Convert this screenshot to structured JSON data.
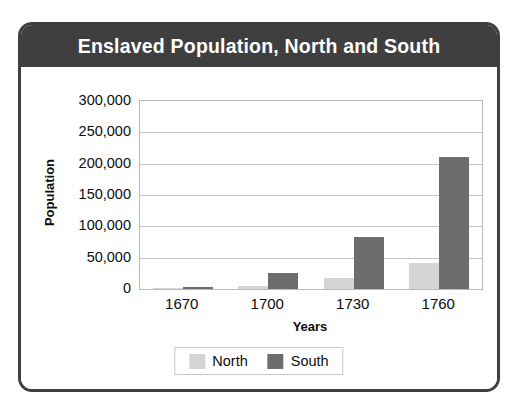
{
  "card": {
    "title": "Enslaved Population, North and South"
  },
  "chart_data": {
    "type": "bar",
    "title": "Enslaved Population, North and South",
    "xlabel": "Years",
    "ylabel": "Population",
    "categories": [
      "1670",
      "1700",
      "1730",
      "1760"
    ],
    "series": [
      {
        "name": "North",
        "color": "#d5d5d5",
        "values": [
          1100,
          5200,
          17000,
          41000
        ]
      },
      {
        "name": "South",
        "color": "#6d6d6d",
        "values": [
          2500,
          25000,
          83000,
          210000
        ]
      }
    ],
    "ylim": [
      0,
      300000
    ],
    "ytick_values": [
      0,
      50000,
      100000,
      150000,
      200000,
      250000,
      300000
    ],
    "ytick_labels": [
      "0",
      "50,000",
      "100,000",
      "150,000",
      "200,000",
      "250,000",
      "300,000"
    ],
    "grid": true,
    "legend_position": "bottom",
    "legend": [
      "North",
      "South"
    ]
  },
  "colors": {
    "title_bar": "#3f3f3f",
    "card_border": "#3f3f3f",
    "north": "#d5d5d5",
    "south": "#6d6d6d",
    "gridline": "#c3c3c3",
    "text": "#0d0d0d"
  }
}
